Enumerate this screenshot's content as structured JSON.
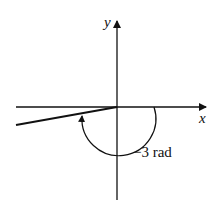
{
  "diagram": {
    "axis_x_label": "x",
    "axis_y_label": "y",
    "angle_label": "−3 rad",
    "colors": {
      "stroke": "#111111",
      "background": "#ffffff"
    }
  }
}
